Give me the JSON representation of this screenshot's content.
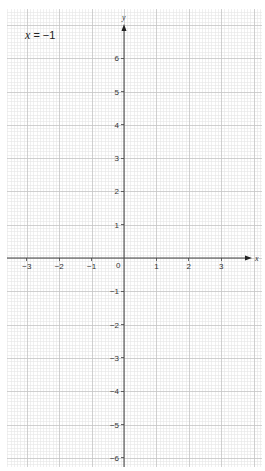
{
  "equation": {
    "variable": "x",
    "rest": " = −1"
  },
  "axes": {
    "x_label": "x",
    "y_label": "y",
    "origin_label": "0"
  },
  "colors": {
    "minor_grid": "#e6e6e6",
    "major_grid": "#c4c4c4",
    "axis": "#444444",
    "text": "#333333"
  },
  "chart_data": {
    "type": "line",
    "title": "x = −1",
    "xlabel": "x",
    "ylabel": "y",
    "xlim": [
      -3.6,
      4.2
    ],
    "ylim": [
      -6.3,
      7.4
    ],
    "x_ticks": [
      -3,
      -2,
      -1,
      0,
      1,
      2,
      3
    ],
    "y_ticks": [
      -6,
      -5,
      -4,
      -3,
      -2,
      -1,
      1,
      2,
      3,
      4,
      5,
      6
    ],
    "grid": true,
    "minor_grid_step": 0.1,
    "major_grid_step": 1,
    "series": [],
    "annotations": [
      "x = −1"
    ]
  }
}
